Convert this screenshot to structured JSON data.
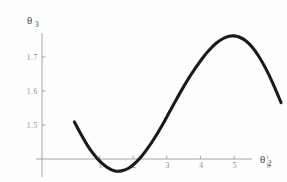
{
  "chart_data": {
    "type": "line",
    "title": "",
    "subtitle": "",
    "xlabel": "θ",
    "xlabel_sub": "2",
    "ylabel": "θ",
    "ylabel_sub": "3",
    "xlim": [
      0.0,
      6.6
    ],
    "ylim": [
      1.33,
      1.79
    ],
    "grid": false,
    "legend": null,
    "axis_origin_y": 1.4,
    "x_ticks": [
      1,
      2,
      3,
      4,
      5,
      6
    ],
    "x_tick_labels": [
      "1",
      "2",
      "3",
      "4",
      "5",
      "6"
    ],
    "y_ticks": [
      1.5,
      1.6,
      1.7
    ],
    "y_tick_labels": [
      "1.5",
      "1.6",
      "1.7"
    ],
    "series": [
      {
        "name": "theta3 vs theta2",
        "color": "#1a1a1a",
        "x": [
          0.25,
          0.45,
          0.65,
          0.85,
          1.05,
          1.25,
          1.45,
          1.65,
          1.85,
          2.05,
          2.25,
          2.45,
          2.65,
          2.85,
          3.05,
          3.25,
          3.45,
          3.65,
          3.85,
          4.05,
          4.25,
          4.45,
          4.65,
          4.85,
          5.0,
          5.15,
          5.35,
          5.55,
          5.75,
          5.95,
          6.15,
          6.4
        ],
        "y": [
          1.509,
          1.472,
          1.438,
          1.411,
          1.389,
          1.374,
          1.365,
          1.365,
          1.372,
          1.387,
          1.408,
          1.434,
          1.464,
          1.497,
          1.533,
          1.569,
          1.604,
          1.637,
          1.667,
          1.695,
          1.719,
          1.739,
          1.753,
          1.761,
          1.762,
          1.759,
          1.748,
          1.728,
          1.7,
          1.665,
          1.624,
          1.566
        ]
      }
    ]
  },
  "axis_labels": {
    "y_axis_symbol": "θ",
    "y_axis_subscript": "3",
    "x_axis_symbol": "θ",
    "x_axis_subscript": "2"
  },
  "colors": {
    "curve": "#1a1a1a",
    "axis": "#9a9a9a",
    "tick_text": "#8d8d8d",
    "background": "#fefefe"
  }
}
